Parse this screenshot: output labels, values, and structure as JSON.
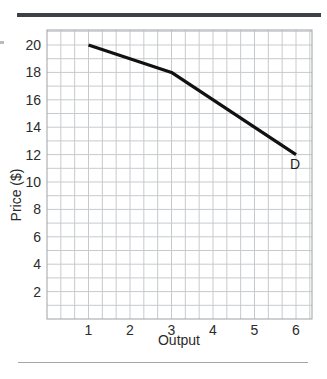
{
  "figure": {
    "top_rule_color": "#3d4044",
    "bottom_rule_color": "#a2a6aa"
  },
  "chart_data": {
    "type": "line",
    "title": "",
    "xlabel": "Output",
    "ylabel": "Price ($)",
    "x_ticks": [
      1,
      2,
      3,
      4,
      5,
      6
    ],
    "y_ticks": [
      2,
      4,
      6,
      8,
      10,
      12,
      14,
      16,
      18,
      20
    ],
    "xlim": [
      0,
      6.4
    ],
    "ylim": [
      0,
      21.1
    ],
    "grid": true,
    "grid_minor_cells_per_x_unit": 3,
    "legend_position": "none",
    "series": [
      {
        "name": "D",
        "points": [
          [
            1,
            20
          ],
          [
            3,
            18
          ],
          [
            6,
            12
          ]
        ],
        "color": "#111111",
        "stroke_width": 3.2,
        "label": {
          "text": "D",
          "x": 5.98,
          "y": 11.3
        }
      }
    ],
    "colors": {
      "grid": "#c7cacd",
      "plot_border": "#9da1a5",
      "text": "#2b2b2b",
      "plot_background": "#ffffff"
    }
  }
}
